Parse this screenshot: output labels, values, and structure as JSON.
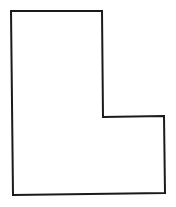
{
  "diagram": {
    "shape": "L-shaped polygon",
    "stroke_color": "#1a1a1a",
    "fill_color": "#ffffff",
    "stroke_width": 2,
    "vertices": [
      [
        11,
        11
      ],
      [
        102,
        11
      ],
      [
        103,
        117
      ],
      [
        164,
        116
      ],
      [
        165,
        193
      ],
      [
        13,
        195
      ]
    ]
  }
}
